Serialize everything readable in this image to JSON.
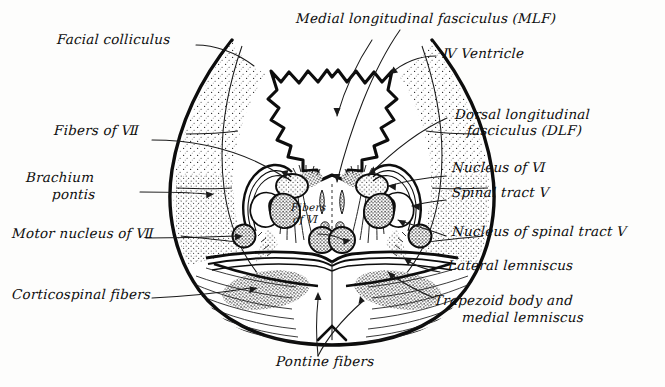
{
  "figure": {
    "background_color": "#fdfdfc",
    "ink_color": "#0d0d0d",
    "style": "hand-drawn pen and ink anatomical line drawing with stipple shading"
  },
  "labels": {
    "facial_colliculus": "Facial colliculus",
    "mlf": "Medial longitudinal fasciculus (MLF)",
    "iv_ventricle": "Ⅳ Ventricle",
    "dlf_line1": "Dorsal longitudinal",
    "dlf_line2": "fasciculus (DLF)",
    "fibers_of_vii": "Fibers of Ⅶ",
    "nucleus_of_vi": "Nucleus of Ⅵ",
    "brachium_line1": "Brachium",
    "brachium_line2": "pontis",
    "spinal_tract_v": "Spinal tract Ⅴ",
    "fibers_of_vi_line1": "Fibers",
    "fibers_of_vi_line2": "of Ⅵ",
    "nucleus_spinal_tract_v": "Nucleus of spinal tract Ⅴ",
    "motor_nucleus_vii": "Motor nucleus of Ⅶ",
    "lateral_lemniscus": "Lateral lemniscus",
    "corticospinal_fibers": "Corticospinal fibers",
    "trapezoid_line1": "Trapezoid body and",
    "trapezoid_line2": "medial lemniscus",
    "pontine_fibers": "Pontine fibers"
  },
  "structures": [
    {
      "name": "facial-colliculus",
      "side": "both",
      "region": "dorsal floor of fourth ventricle"
    },
    {
      "name": "medial-longitudinal-fasciculus",
      "side": "both",
      "region": "paramedian dorsal tegmentum"
    },
    {
      "name": "fourth-ventricle",
      "side": "midline",
      "region": "dorsal cavity"
    },
    {
      "name": "dorsal-longitudinal-fasciculus",
      "side": "both",
      "region": "periventricular gray"
    },
    {
      "name": "fibers-of-vii",
      "side": "both",
      "region": "internal genu around abducens nucleus"
    },
    {
      "name": "nucleus-of-vi",
      "side": "both",
      "region": "dorsal paramedian tegmentum"
    },
    {
      "name": "brachium-pontis",
      "side": "both",
      "region": "lateral stippled middle cerebellar peduncle"
    },
    {
      "name": "spinal-tract-v",
      "side": "both",
      "region": "lateral tegmentum"
    },
    {
      "name": "nucleus-of-spinal-tract-v",
      "side": "both",
      "region": "lateral tegmentum deep to tract"
    },
    {
      "name": "motor-nucleus-of-vii",
      "side": "both",
      "region": "ventrolateral tegmentum"
    },
    {
      "name": "lateral-lemniscus",
      "side": "both",
      "region": "lateral tegmentum stipple band"
    },
    {
      "name": "corticospinal-fibers",
      "side": "both",
      "region": "basis pontis bundles"
    },
    {
      "name": "trapezoid-body-and-medial-lemniscus",
      "side": "both",
      "region": "ventral tegmentum transverse band"
    },
    {
      "name": "pontine-fibers",
      "side": "both",
      "region": "basis pontis transverse fibers"
    }
  ]
}
